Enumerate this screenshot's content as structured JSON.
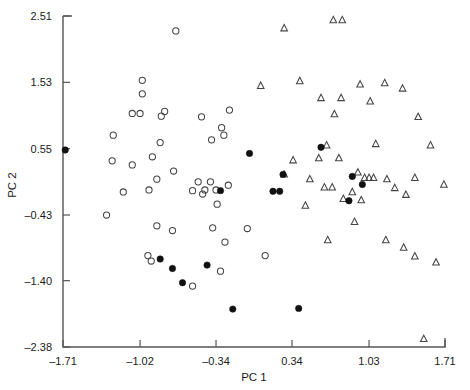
{
  "chart_data": {
    "type": "scatter",
    "title": "",
    "xlabel": "PC 1",
    "ylabel": "PC 2",
    "xlim": [
      -1.71,
      1.71
    ],
    "ylim": [
      -2.38,
      2.51
    ],
    "xticks": [
      "-1.71",
      "-1.02",
      "-0.34",
      "0.34",
      "1.03",
      "1.71"
    ],
    "xtick_values": [
      -1.71,
      -1.02,
      -0.34,
      0.34,
      1.03,
      1.71
    ],
    "yticks": [
      "2.51",
      "1.53",
      "0.55",
      "-0.43",
      "-1.40",
      "-2.38"
    ],
    "ytick_values": [
      2.51,
      1.53,
      0.55,
      -0.43,
      -1.4,
      -2.38
    ],
    "grid": false,
    "legend_position": "none",
    "series": [
      {
        "name": "open-circle",
        "marker": "open-circle",
        "color": "#444444",
        "points": [
          [
            -0.7,
            2.29
          ],
          [
            -1.0,
            1.56
          ],
          [
            -1.0,
            1.36
          ],
          [
            -1.09,
            1.07
          ],
          [
            -1.02,
            1.07
          ],
          [
            -0.8,
            1.1
          ],
          [
            -0.83,
            1.03
          ],
          [
            -0.47,
            1.02
          ],
          [
            -1.26,
            0.75
          ],
          [
            -0.29,
            0.86
          ],
          [
            -0.27,
            0.75
          ],
          [
            -0.38,
            0.68
          ],
          [
            -0.84,
            0.64
          ],
          [
            -0.91,
            0.43
          ],
          [
            -1.27,
            0.37
          ],
          [
            -1.09,
            0.31
          ],
          [
            -0.72,
            0.22
          ],
          [
            -0.87,
            0.1
          ],
          [
            -1.17,
            -0.09
          ],
          [
            -0.94,
            -0.06
          ],
          [
            -0.5,
            0.06
          ],
          [
            -0.39,
            0.06
          ],
          [
            -0.44,
            -0.06
          ],
          [
            -0.55,
            -0.07
          ],
          [
            -0.46,
            -0.12
          ],
          [
            -0.23,
            0.01
          ],
          [
            -0.34,
            -0.06
          ],
          [
            -1.32,
            -0.43
          ],
          [
            -0.33,
            -0.27
          ],
          [
            -0.87,
            -0.59
          ],
          [
            -0.73,
            -0.66
          ],
          [
            -0.37,
            -0.62
          ],
          [
            -0.06,
            -0.63
          ],
          [
            -0.26,
            -0.83
          ],
          [
            -0.95,
            -1.03
          ],
          [
            -0.92,
            -1.11
          ],
          [
            -0.3,
            -1.26
          ],
          [
            0.1,
            -1.03
          ],
          [
            -0.55,
            -1.48
          ],
          [
            -0.22,
            1.12
          ]
        ]
      },
      {
        "name": "triangle",
        "marker": "open-triangle",
        "color": "#444444",
        "points": [
          [
            0.71,
            2.45
          ],
          [
            0.79,
            2.45
          ],
          [
            0.27,
            2.33
          ],
          [
            0.41,
            1.55
          ],
          [
            1.17,
            1.52
          ],
          [
            0.06,
            1.48
          ],
          [
            0.95,
            1.5
          ],
          [
            1.33,
            1.44
          ],
          [
            0.6,
            1.3
          ],
          [
            0.78,
            1.3
          ],
          [
            1.04,
            1.25
          ],
          [
            0.72,
            1.06
          ],
          [
            1.47,
            1.02
          ],
          [
            0.65,
            0.6
          ],
          [
            1.09,
            0.62
          ],
          [
            1.58,
            0.6
          ],
          [
            0.35,
            0.38
          ],
          [
            0.58,
            0.41
          ],
          [
            0.76,
            0.41
          ],
          [
            0.93,
            0.2
          ],
          [
            0.27,
            0.17
          ],
          [
            0.5,
            0.1
          ],
          [
            0.99,
            0.12
          ],
          [
            1.03,
            0.12
          ],
          [
            1.07,
            0.12
          ],
          [
            1.19,
            0.1
          ],
          [
            1.44,
            0.12
          ],
          [
            0.63,
            -0.02
          ],
          [
            0.7,
            -0.02
          ],
          [
            1.26,
            -0.03
          ],
          [
            1.7,
            0.02
          ],
          [
            0.88,
            -0.09
          ],
          [
            1.36,
            -0.13
          ],
          [
            0.8,
            -0.19
          ],
          [
            0.96,
            -0.21
          ],
          [
            0.46,
            -0.29
          ],
          [
            0.9,
            -0.53
          ],
          [
            0.66,
            -0.8
          ],
          [
            1.18,
            -0.8
          ],
          [
            1.34,
            -0.91
          ],
          [
            1.44,
            -1.04
          ],
          [
            1.63,
            -1.13
          ],
          [
            1.52,
            -2.26
          ]
        ]
      },
      {
        "name": "filled-circle",
        "marker": "filled-circle",
        "color": "#111111",
        "points": [
          [
            -1.69,
            0.53
          ],
          [
            -0.04,
            0.48
          ],
          [
            0.6,
            0.57
          ],
          [
            0.26,
            0.17
          ],
          [
            0.88,
            0.14
          ],
          [
            0.97,
            0.02
          ],
          [
            0.17,
            -0.08
          ],
          [
            0.23,
            -0.08
          ],
          [
            -0.3,
            -0.07
          ],
          [
            0.85,
            -0.22
          ],
          [
            -0.84,
            -1.08
          ],
          [
            -0.73,
            -1.22
          ],
          [
            -0.42,
            -1.17
          ],
          [
            -0.64,
            -1.43
          ],
          [
            -0.19,
            -1.82
          ],
          [
            0.4,
            -1.81
          ]
        ]
      }
    ]
  },
  "axis": {
    "x_title": "PC 1",
    "y_title": "PC 2"
  }
}
